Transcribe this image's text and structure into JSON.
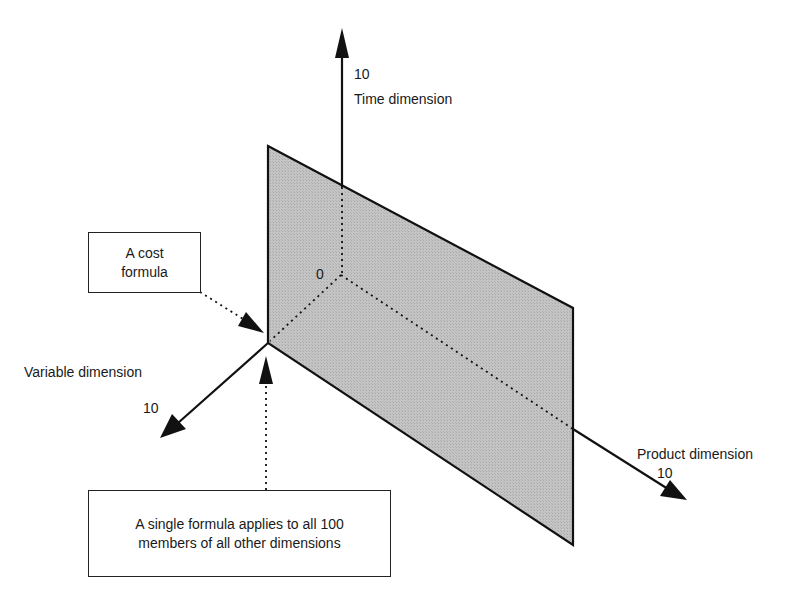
{
  "diagram": {
    "plane_fill": "#bdbdbd",
    "axes": {
      "time": {
        "label": "Time dimension",
        "max_tick": "10"
      },
      "variable": {
        "label": "Variable dimension",
        "max_tick": "10"
      },
      "product": {
        "label": "Product dimension",
        "max_tick": "10"
      },
      "origin_tick": "0"
    },
    "callouts": {
      "cost_formula": {
        "line1": "A cost",
        "line2": "formula"
      },
      "single_formula": {
        "line1": "A single formula applies to all 100",
        "line2": "members of all other dimensions"
      }
    }
  }
}
